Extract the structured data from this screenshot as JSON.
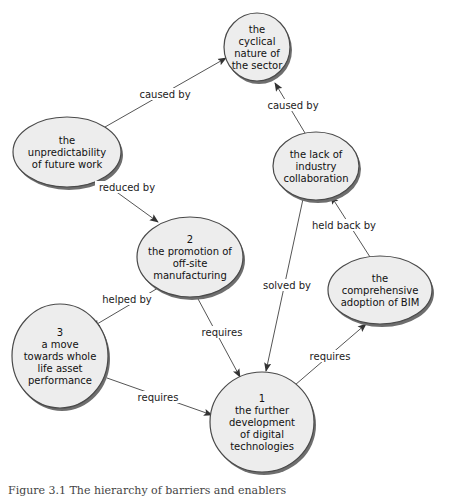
{
  "diagram": {
    "nodes": [
      {
        "id": "cyclical",
        "lines": [
          "the",
          "cyclical",
          "nature of",
          "the sector"
        ],
        "cx": 257,
        "cy": 47,
        "rx": 33,
        "ry": 34
      },
      {
        "id": "unpredictability",
        "lines": [
          "the",
          "unpredictability",
          "of future work"
        ],
        "cx": 67,
        "cy": 152,
        "rx": 54,
        "ry": 35
      },
      {
        "id": "lack-collaboration",
        "lines": [
          "the lack of",
          "industry",
          "collaboration"
        ],
        "cx": 316,
        "cy": 166,
        "rx": 43,
        "ry": 34
      },
      {
        "id": "promotion-offsite",
        "lines": [
          "2",
          "the promotion of",
          "off-site",
          "manufacturing"
        ],
        "cx": 190,
        "cy": 257,
        "rx": 53,
        "ry": 40
      },
      {
        "id": "adoption-bim",
        "lines": [
          "the",
          "comprehensive",
          "adoption of BIM"
        ],
        "cx": 380,
        "cy": 290,
        "rx": 52,
        "ry": 34
      },
      {
        "id": "whole-life",
        "lines": [
          "3",
          "a move",
          "towards whole",
          "life asset",
          "performance"
        ],
        "cx": 60,
        "cy": 356,
        "rx": 48,
        "ry": 52
      },
      {
        "id": "digital-tech",
        "lines": [
          "1",
          "the further",
          "development",
          "of digital",
          "technologies"
        ],
        "cx": 262,
        "cy": 422,
        "rx": 52,
        "ry": 50
      }
    ],
    "edges": [
      {
        "from": "unpredictability",
        "to": "cyclical",
        "label": "caused by",
        "x1": 105,
        "y1": 127,
        "x2": 226,
        "y2": 58,
        "lx": 165,
        "ly": 96
      },
      {
        "from": "lack-collaboration",
        "to": "cyclical",
        "label": "caused by",
        "x1": 305,
        "y1": 133,
        "x2": 275,
        "y2": 83,
        "lx": 293,
        "ly": 107
      },
      {
        "from": "unpredictability",
        "to": "promotion-offsite",
        "label": "reduced by",
        "x1": 100,
        "y1": 180,
        "x2": 158,
        "y2": 222,
        "lx": 127,
        "ly": 189
      },
      {
        "from": "adoption-bim",
        "to": "lack-collaboration",
        "label": "held back by",
        "x1": 370,
        "y1": 257,
        "x2": 331,
        "y2": 196,
        "lx": 344,
        "ly": 227
      },
      {
        "from": "lack-collaboration",
        "to": "digital-tech",
        "label": "solved by",
        "x1": 303,
        "y1": 199,
        "x2": 266,
        "y2": 371,
        "lx": 287,
        "ly": 287
      },
      {
        "from": "promotion-offsite",
        "to": "whole-life",
        "label": "helped by",
        "x1": 158,
        "y1": 288,
        "x2": 92,
        "y2": 327,
        "lx": 127,
        "ly": 301
      },
      {
        "from": "promotion-offsite",
        "to": "digital-tech",
        "label": "requires",
        "x1": 197,
        "y1": 297,
        "x2": 240,
        "y2": 377,
        "lx": 222,
        "ly": 334
      },
      {
        "from": "digital-tech",
        "to": "adoption-bim",
        "label": "requires",
        "x1": 295,
        "y1": 385,
        "x2": 366,
        "y2": 324,
        "lx": 330,
        "ly": 358
      },
      {
        "from": "whole-life",
        "to": "digital-tech",
        "label": "requires",
        "x1": 107,
        "y1": 378,
        "x2": 212,
        "y2": 415,
        "lx": 158,
        "ly": 399
      }
    ]
  },
  "caption": {
    "text": "Figure 3.1 The hierarchy of barriers and enablers"
  }
}
